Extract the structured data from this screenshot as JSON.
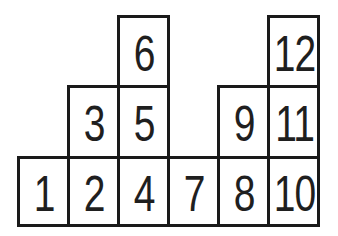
{
  "figure": {
    "colors": {
      "background": "#ffffff",
      "line": "#1a1a1a",
      "text": "#1f1f1f"
    },
    "columns": [
      {
        "height": 1,
        "numbers": [
          "1"
        ]
      },
      {
        "height": 2,
        "numbers": [
          "2",
          "3"
        ]
      },
      {
        "height": 3,
        "numbers": [
          "4",
          "5",
          "6"
        ]
      },
      {
        "height": 1,
        "numbers": [
          "7"
        ]
      },
      {
        "height": 2,
        "numbers": [
          "8",
          "9"
        ]
      },
      {
        "height": 3,
        "numbers": [
          "10",
          "11",
          "12"
        ]
      }
    ],
    "cells": [
      {
        "label": "1",
        "col": 0,
        "level": 0
      },
      {
        "label": "2",
        "col": 1,
        "level": 0
      },
      {
        "label": "3",
        "col": 1,
        "level": 1
      },
      {
        "label": "4",
        "col": 2,
        "level": 0
      },
      {
        "label": "5",
        "col": 2,
        "level": 1
      },
      {
        "label": "6",
        "col": 2,
        "level": 2
      },
      {
        "label": "7",
        "col": 3,
        "level": 0
      },
      {
        "label": "8",
        "col": 4,
        "level": 0
      },
      {
        "label": "9",
        "col": 4,
        "level": 1
      },
      {
        "label": "10",
        "col": 5,
        "level": 0
      },
      {
        "label": "11",
        "col": 5,
        "level": 1
      },
      {
        "label": "12",
        "col": 5,
        "level": 2
      }
    ]
  }
}
